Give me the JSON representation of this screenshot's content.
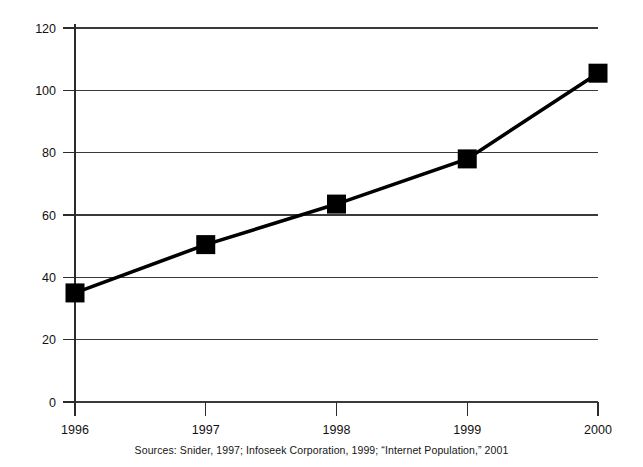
{
  "chart_data": {
    "type": "line",
    "title": "",
    "subtitle": "",
    "xlabel": "",
    "ylabel": "",
    "categories": [
      "1996",
      "1997",
      "1998",
      "1999",
      "2000"
    ],
    "values": [
      35,
      50.5,
      63.5,
      78,
      105.5
    ],
    "series": [
      {
        "name": "Internet population",
        "values": [
          35,
          50.5,
          63.5,
          78,
          105.5
        ]
      }
    ],
    "ylim": [
      0,
      120
    ],
    "y_ticks": [
      "0",
      "20",
      "40",
      "60",
      "80",
      "100",
      "120"
    ],
    "y_tick_values": [
      0,
      20,
      40,
      60,
      80,
      100,
      120
    ],
    "x_ticks": [
      "1996",
      "1997",
      "1998",
      "1999",
      "2000"
    ],
    "grid": "horizontal",
    "legend": "none",
    "marker": "square",
    "line_color": "#000000",
    "marker_color": "#000000",
    "grid_color": "#3a3a3a",
    "background_color": "#ffffff"
  },
  "caption": {
    "source_note": "Sources: Snider, 1997; Infoseek Corporation, 1999; “Internet Population,” 2001"
  }
}
